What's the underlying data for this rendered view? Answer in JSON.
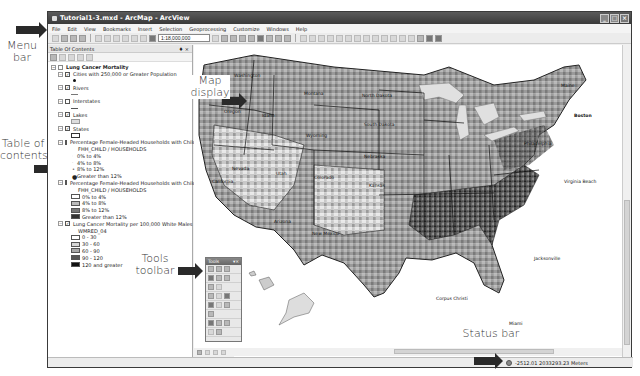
{
  "window": {
    "title": "Tutorial1-3.mxd - ArcMap - ArcView",
    "controls": [
      "minimize",
      "maximize",
      "close"
    ]
  },
  "menubar": {
    "items": [
      "File",
      "Edit",
      "View",
      "Bookmarks",
      "Insert",
      "Selection",
      "Geoprocessing",
      "Customize",
      "Windows",
      "Help"
    ]
  },
  "toolbar": {
    "scale": "1:18,000,000"
  },
  "toc": {
    "title": "Table Of Contents",
    "data_frame": "Lung Cancer Mortality",
    "layers": [
      {
        "name": "Cities with 250,000 or Greater Population",
        "checked": true
      },
      {
        "name": "Rivers",
        "checked": true
      },
      {
        "name": "Interstates",
        "checked": false
      },
      {
        "name": "Lakes",
        "checked": true
      },
      {
        "name": "States",
        "checked": true
      },
      {
        "name": "Percentage Female-Headed Households with Children",
        "checked": false,
        "field": "FHH_CHILD / HOUSEHOLDS",
        "classes": [
          "0% to 4%",
          "4% to 8%",
          "8% to 12%",
          "Greater than 12%"
        ]
      },
      {
        "name": "Percentage Female-Headed Households with Children",
        "checked": false,
        "field": "FHH_CHILD / HOUSEHOLDS",
        "classes": [
          "0% to 4%",
          "4% to 8%",
          "8% to 12%",
          "Greater than 12%"
        ]
      },
      {
        "name": "Lung Cancer Mortality per 100,000 White Males",
        "checked": true,
        "field": "WMRED_04",
        "classes": [
          "0 - 30",
          "30 - 60",
          "60 - 90",
          "90 - 120",
          "120 and greater"
        ]
      }
    ]
  },
  "map": {
    "labels": [
      "Washington",
      "Montana",
      "North Dakota",
      "Oregon",
      "Idaho",
      "South Dakota",
      "Wyoming",
      "Nevada",
      "Nebraska",
      "Utah",
      "Colorado",
      "Kansas",
      "California",
      "Arizona",
      "New Mexico",
      "Maine",
      "Boston",
      "Virginia Beach",
      "Jacksonville",
      "Miami",
      "Corpus Christi",
      "Philadelphia"
    ]
  },
  "tools_window": {
    "title": "Tools"
  },
  "status": {
    "coordinates": "-2512.01  2033293.23 Meters"
  },
  "callouts": {
    "menu_bar": "Menu\nbar",
    "map_display": "Map\ndisplay",
    "table_of_contents": "Table of\ncontents",
    "tools_toolbar": "Tools\ntoolbar",
    "status_bar": "Status bar"
  },
  "colors": {
    "titlebar": "#3a3a3a",
    "class_0_30": "#ffffff",
    "class_30_60": "#d6d6d6",
    "class_60_90": "#a8a8a8",
    "class_90_120": "#555555",
    "class_120_plus": "#111111"
  }
}
